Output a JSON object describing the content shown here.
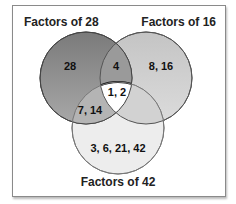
{
  "diagram": {
    "type": "venn",
    "sets": [
      {
        "label": "Factors of 28",
        "color": "#8c8c8c"
      },
      {
        "label": "Factors of 16",
        "color": "#c8c8c8"
      },
      {
        "label": "Factors of 42",
        "color": "#ececec"
      }
    ],
    "regions": {
      "only_28": "28",
      "only_16": "8, 16",
      "only_42": "3, 6, 21, 42",
      "28_and_16": "4",
      "28_and_42": "7, 14",
      "16_and_42": "",
      "all_three": "1, 2"
    }
  }
}
